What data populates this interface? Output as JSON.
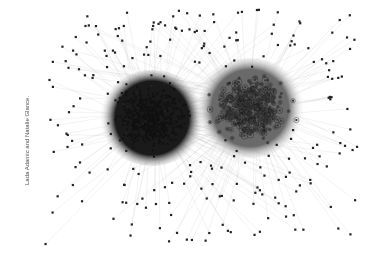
{
  "figure": {
    "caption": "Lada Adamic and Natalie Glance.",
    "background": "#ffffff",
    "edge_color": "#b0b0b0",
    "clusters": [
      {
        "name": "left-cluster",
        "cx": 152,
        "cy": 118,
        "r": 48,
        "nodes": 520,
        "node_color": "#111111",
        "core_color": "#1a1a1a"
      },
      {
        "name": "right-cluster",
        "cx": 250,
        "cy": 108,
        "r": 50,
        "nodes": 420,
        "node_color": "#3a3a3a",
        "core_color": "#6a6a6a"
      }
    ],
    "periphery_nodes": 380
  }
}
